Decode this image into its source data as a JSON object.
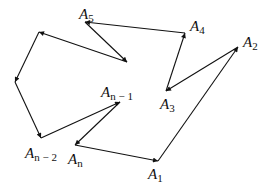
{
  "diagram": {
    "points": [
      {
        "id": "A1",
        "label": "A",
        "sub": "1",
        "x": 158,
        "y": 161,
        "lx": 148,
        "ly": 167
      },
      {
        "id": "A2",
        "label": "A",
        "sub": "2",
        "x": 238,
        "y": 47,
        "lx": 243,
        "ly": 35
      },
      {
        "id": "A3",
        "label": "A",
        "sub": "3",
        "x": 166,
        "y": 91,
        "lx": 160,
        "ly": 97
      },
      {
        "id": "A4",
        "label": "A",
        "sub": "4",
        "x": 185,
        "y": 33,
        "lx": 190,
        "ly": 19
      },
      {
        "id": "A5",
        "label": "A",
        "sub": "5",
        "x": 85,
        "y": 22,
        "lx": 79,
        "ly": 7
      },
      {
        "id": "P6",
        "label": "",
        "sub": "",
        "x": 127,
        "y": 62
      },
      {
        "id": "P7",
        "label": "",
        "sub": "",
        "x": 39,
        "y": 32
      },
      {
        "id": "P8",
        "label": "",
        "sub": "",
        "x": 15,
        "y": 82
      },
      {
        "id": "An-2",
        "label": "A",
        "sub": "n − 2",
        "x": 41,
        "y": 138,
        "lx": 25,
        "ly": 146
      },
      {
        "id": "An-1",
        "label": "A",
        "sub": "n − 1",
        "x": 120,
        "y": 102,
        "lx": 101,
        "ly": 85
      },
      {
        "id": "An",
        "label": "A",
        "sub": "n",
        "x": 75,
        "y": 145,
        "lx": 68,
        "ly": 152
      }
    ],
    "edges": [
      {
        "from": "A1",
        "to": "A2"
      },
      {
        "from": "A2",
        "to": "A3"
      },
      {
        "from": "A3",
        "to": "A4"
      },
      {
        "from": "A4",
        "to": "A5"
      },
      {
        "from": "A5",
        "to": "P6"
      },
      {
        "from": "P6",
        "to": "P7"
      },
      {
        "from": "P7",
        "to": "P8"
      },
      {
        "from": "P8",
        "to": "An-2"
      },
      {
        "from": "An-2",
        "to": "An-1"
      },
      {
        "from": "An-1",
        "to": "An"
      },
      {
        "from": "An",
        "to": "A1"
      }
    ],
    "stroke_color": "#111111"
  }
}
